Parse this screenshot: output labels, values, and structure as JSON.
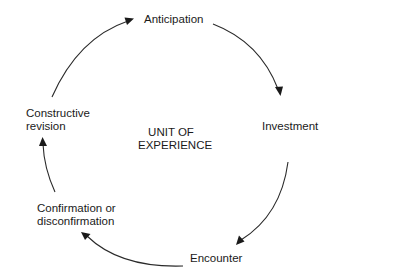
{
  "diagram": {
    "type": "cycle",
    "center_label": {
      "line1": "UNIT OF",
      "line2": "EXPERIENCE"
    },
    "stages": [
      {
        "id": "anticipation",
        "line1": "Anticipation",
        "line2": ""
      },
      {
        "id": "investment",
        "line1": "Investment",
        "line2": ""
      },
      {
        "id": "encounter",
        "line1": "Encounter",
        "line2": ""
      },
      {
        "id": "confirmation",
        "line1": "Confirmation or",
        "line2": "disconfirmation"
      },
      {
        "id": "revision",
        "line1": "Constructive",
        "line2": "revision"
      }
    ],
    "edges": [
      {
        "from": "revision",
        "to": "anticipation"
      },
      {
        "from": "anticipation",
        "to": "investment"
      },
      {
        "from": "investment",
        "to": "encounter"
      },
      {
        "from": "encounter",
        "to": "confirmation"
      },
      {
        "from": "confirmation",
        "to": "revision"
      }
    ],
    "colors": {
      "background": "#ffffff",
      "ink": "#1a1a1a"
    }
  }
}
